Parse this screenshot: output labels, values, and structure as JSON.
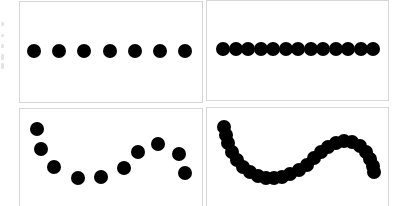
{
  "colors": {
    "dot": "#000000",
    "panel_border": "#d6d6d6",
    "background": "#ffffff"
  },
  "panels": [
    {
      "id": "panel-top-left",
      "description": "sparse straight line of dots",
      "box": {
        "left": 19,
        "top": 1,
        "width": 184,
        "height": 102
      },
      "dot_diameter": 14,
      "dots": [
        [
          34,
          51
        ],
        [
          59,
          51
        ],
        [
          84,
          51
        ],
        [
          110,
          51
        ],
        [
          135,
          51
        ],
        [
          160,
          51
        ],
        [
          185,
          51
        ]
      ]
    },
    {
      "id": "panel-top-right",
      "description": "dense straight line of dots",
      "box": {
        "left": 206,
        "top": 0,
        "width": 183,
        "height": 101
      },
      "dot_diameter": 14,
      "dots": [
        [
          223,
          49
        ],
        [
          235.5,
          49
        ],
        [
          248,
          49
        ],
        [
          260.5,
          49
        ],
        [
          273,
          49
        ],
        [
          285.5,
          49
        ],
        [
          298,
          49
        ],
        [
          310.5,
          49
        ],
        [
          323,
          49
        ],
        [
          335.5,
          49
        ],
        [
          348,
          49
        ],
        [
          360.5,
          49
        ],
        [
          373,
          49
        ]
      ]
    },
    {
      "id": "panel-bottom-left",
      "description": "sparse curved line of dots",
      "box": {
        "left": 19,
        "top": 108,
        "width": 184,
        "height": 100
      },
      "dot_diameter": 14,
      "dots": [
        [
          37,
          129
        ],
        [
          41,
          149
        ],
        [
          54,
          167
        ],
        [
          78,
          178
        ],
        [
          101,
          177
        ],
        [
          124,
          168
        ],
        [
          138,
          152
        ],
        [
          158,
          144
        ],
        [
          179,
          154
        ],
        [
          185,
          173
        ]
      ]
    },
    {
      "id": "panel-bottom-right",
      "description": "dense curved line of dots",
      "box": {
        "left": 206,
        "top": 107,
        "width": 183,
        "height": 101
      },
      "dot_diameter": 14,
      "dots": [
        [
          224,
          127
        ],
        [
          226,
          135
        ],
        [
          228,
          143
        ],
        [
          232,
          152
        ],
        [
          237,
          160
        ],
        [
          243,
          167
        ],
        [
          250,
          172
        ],
        [
          258,
          176
        ],
        [
          266,
          178
        ],
        [
          274,
          178
        ],
        [
          282,
          177
        ],
        [
          290,
          174
        ],
        [
          299,
          170
        ],
        [
          307,
          165
        ],
        [
          314,
          158
        ],
        [
          321,
          152
        ],
        [
          328,
          147
        ],
        [
          336,
          143
        ],
        [
          344,
          141
        ],
        [
          352,
          142
        ],
        [
          360,
          146
        ],
        [
          366,
          152
        ],
        [
          370,
          159
        ],
        [
          373,
          166
        ],
        [
          374,
          172
        ]
      ]
    }
  ]
}
